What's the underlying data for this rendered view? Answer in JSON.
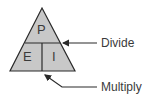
{
  "diagram": {
    "cells": {
      "top": "P",
      "bottom_left": "E",
      "bottom_right": "I"
    },
    "annotations": [
      {
        "label": "Divide",
        "points_to": "horizontal-divider"
      },
      {
        "label": "Multiply",
        "points_to": "vertical-divider"
      }
    ],
    "colors": {
      "fill": "#c8c8c8",
      "stroke": "#2a2a2a",
      "text": "#3a3a3a"
    }
  }
}
